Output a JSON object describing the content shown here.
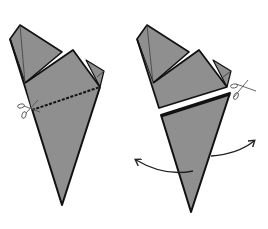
{
  "diagram": {
    "type": "origami-instruction",
    "colors": {
      "paper_fill": "#8f8f8f",
      "outline": "#111111",
      "background": "#ffffff",
      "scissors": "#555555",
      "arrow": "#222222"
    },
    "steps": [
      {
        "id": "step-cut",
        "elements": [
          "folded-cone",
          "dashed-cut-line",
          "scissors-icon"
        ]
      },
      {
        "id": "step-open",
        "elements": [
          "upper-piece",
          "lower-triangle",
          "scissors-icon",
          "open-left-arrow",
          "open-right-arrow"
        ]
      }
    ]
  }
}
